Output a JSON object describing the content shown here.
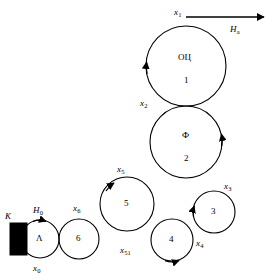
{
  "diagram": {
    "type": "tangent-circle-chain-scheme",
    "background": "#ffffff",
    "stroke_color": "#000000",
    "fill_color": "#ffffff",
    "block_fill": "#000000",
    "nodes": [
      {
        "id": "n1",
        "number": "1",
        "caption": "ОЦ",
        "cx": 186,
        "cy": 66,
        "r": 40
      },
      {
        "id": "n2",
        "number": "2",
        "caption": "Ф",
        "cx": 186,
        "cy": 142,
        "r": 36
      },
      {
        "id": "n3",
        "number": "3",
        "caption": "",
        "cx": 214,
        "cy": 212,
        "r": 21
      },
      {
        "id": "n4",
        "number": "4",
        "caption": "",
        "cx": 172,
        "cy": 240,
        "r": 21
      },
      {
        "id": "n5",
        "number": "5",
        "caption": "",
        "cx": 127,
        "cy": 204,
        "r": 27
      },
      {
        "id": "n6",
        "number": "6",
        "caption": "",
        "cx": 79,
        "cy": 239,
        "r": 20
      },
      {
        "id": "n7",
        "number": "",
        "caption": "Λ",
        "cx": 40,
        "cy": 239,
        "r": 19
      }
    ],
    "edge_labels": [
      {
        "name": "x1",
        "base": "x",
        "sub": "1",
        "x": 174,
        "y": 8
      },
      {
        "name": "x2",
        "base": "x",
        "sub": "2",
        "x": 140,
        "y": 99
      },
      {
        "name": "x3",
        "base": "x",
        "sub": "3",
        "x": 224,
        "y": 182
      },
      {
        "name": "x4",
        "base": "x",
        "sub": "4",
        "x": 196,
        "y": 239
      },
      {
        "name": "x5",
        "base": "x",
        "sub": "5",
        "x": 117,
        "y": 165
      },
      {
        "name": "x51",
        "base": "x",
        "sub": "51",
        "x": 120,
        "y": 246
      },
      {
        "name": "x6",
        "base": "x",
        "sub": "6",
        "x": 73,
        "y": 204
      },
      {
        "name": "x0",
        "base": "x",
        "sub": "0",
        "x": 33,
        "y": 264
      },
      {
        "name": "H0",
        "base": "H",
        "sub": "0",
        "x": 33,
        "y": 206
      },
      {
        "name": "Ha",
        "base": "H",
        "sub": "a",
        "x": 230,
        "y": 25
      }
    ],
    "source_marker": {
      "label": "K",
      "x": 5,
      "y": 212
    },
    "output_arrow": {
      "label_ref": "Ha",
      "from_x": 186,
      "to_x": 266,
      "y": 17
    }
  }
}
